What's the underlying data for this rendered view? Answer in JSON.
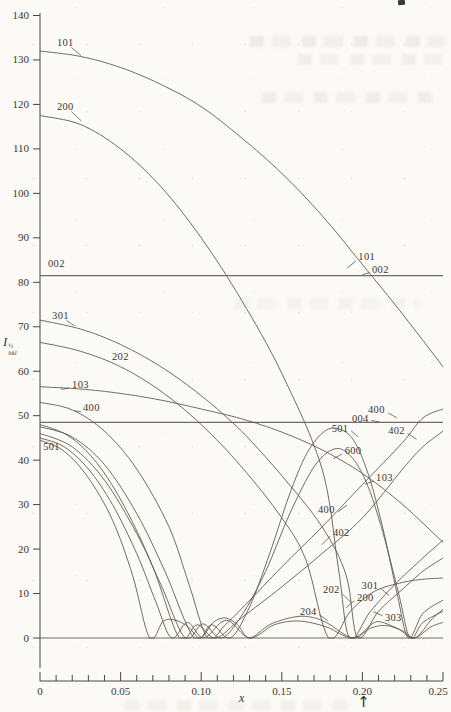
{
  "chart_data": {
    "type": "line",
    "title": "",
    "xlabel": "x",
    "ylabel": {
      "base": "I",
      "sup": "½",
      "sub": "hkl"
    },
    "xlim": [
      0,
      0.25
    ],
    "ylim": [
      0,
      140
    ],
    "grid": false,
    "legend": "none (curves labeled inline by hkl index)",
    "x_ticks": {
      "major": [
        0,
        0.05,
        0.1,
        0.15,
        0.2,
        0.25
      ],
      "labels": [
        "0",
        "0.05",
        "0.10",
        "0.15",
        "0.20",
        "0.25"
      ],
      "minor_step": 0.01
    },
    "y_ticks": {
      "values": [
        0,
        10,
        20,
        30,
        40,
        50,
        60,
        70,
        80,
        90,
        100,
        110,
        120,
        130,
        140
      ],
      "labels": [
        "0",
        "10",
        "20",
        "30",
        "40",
        "50",
        "60",
        "70",
        "80",
        "90",
        "100",
        "110",
        "120",
        "130",
        "140"
      ]
    },
    "series": [
      {
        "name": "101",
        "points": [
          [
            0,
            132
          ],
          [
            0.025,
            130.8
          ],
          [
            0.05,
            128.3
          ],
          [
            0.075,
            124.5
          ],
          [
            0.1,
            119.5
          ],
          [
            0.125,
            112.5
          ],
          [
            0.15,
            104.5
          ],
          [
            0.175,
            95
          ],
          [
            0.2,
            84
          ],
          [
            0.225,
            72.8
          ],
          [
            0.25,
            61
          ]
        ]
      },
      {
        "name": "200",
        "points": [
          [
            0,
            117.5
          ],
          [
            0.025,
            115.5
          ],
          [
            0.05,
            110
          ],
          [
            0.075,
            101.5
          ],
          [
            0.1,
            90
          ],
          [
            0.125,
            76
          ],
          [
            0.15,
            59.5
          ],
          [
            0.175,
            38
          ],
          [
            0.185,
            16
          ],
          [
            0.192,
            0
          ],
          [
            0.205,
            6
          ],
          [
            0.22,
            12
          ],
          [
            0.2375,
            18
          ],
          [
            0.25,
            22
          ]
        ]
      },
      {
        "name": "002",
        "points": [
          [
            0,
            81.5
          ],
          [
            0.25,
            81.5
          ]
        ]
      },
      {
        "name": "004",
        "points": [
          [
            0,
            48.5
          ],
          [
            0.25,
            48.5
          ]
        ]
      },
      {
        "name": "301",
        "points": [
          [
            0,
            71.5
          ],
          [
            0.025,
            69.5
          ],
          [
            0.05,
            66
          ],
          [
            0.075,
            61
          ],
          [
            0.1,
            54.5
          ],
          [
            0.125,
            46.5
          ],
          [
            0.15,
            36.5
          ],
          [
            0.175,
            25
          ],
          [
            0.19,
            14
          ],
          [
            0.197,
            0
          ],
          [
            0.21,
            6
          ],
          [
            0.225,
            11
          ],
          [
            0.2375,
            15
          ],
          [
            0.25,
            18
          ]
        ]
      },
      {
        "name": "202",
        "points": [
          [
            0,
            66.5
          ],
          [
            0.025,
            64.5
          ],
          [
            0.05,
            61
          ],
          [
            0.075,
            55.5
          ],
          [
            0.1,
            48
          ],
          [
            0.125,
            38.5
          ],
          [
            0.15,
            27
          ],
          [
            0.165,
            17.5
          ],
          [
            0.179,
            0
          ],
          [
            0.1925,
            6
          ],
          [
            0.2075,
            10.5
          ],
          [
            0.225,
            12.5
          ],
          [
            0.2375,
            13.2
          ],
          [
            0.25,
            13.5
          ]
        ]
      },
      {
        "name": "103",
        "points": [
          [
            0,
            56.5
          ],
          [
            0.025,
            56
          ],
          [
            0.05,
            55
          ],
          [
            0.075,
            53.5
          ],
          [
            0.1,
            51.5
          ],
          [
            0.125,
            49.3
          ],
          [
            0.15,
            46.3
          ],
          [
            0.175,
            42.3
          ],
          [
            0.2,
            37
          ],
          [
            0.225,
            30
          ],
          [
            0.25,
            21.5
          ]
        ]
      },
      {
        "name": "400",
        "points": [
          [
            0,
            53
          ],
          [
            0.02,
            51.3
          ],
          [
            0.04,
            46.5
          ],
          [
            0.06,
            38
          ],
          [
            0.08,
            25
          ],
          [
            0.0925,
            12
          ],
          [
            0.104,
            0
          ],
          [
            0.115,
            3
          ],
          [
            0.1275,
            7.5
          ],
          [
            0.15,
            16
          ],
          [
            0.175,
            25
          ],
          [
            0.2,
            34.5
          ],
          [
            0.225,
            44
          ],
          [
            0.2375,
            49.5
          ],
          [
            0.25,
            51.5
          ]
        ]
      },
      {
        "name": "402",
        "points": [
          [
            0,
            48
          ],
          [
            0.0175,
            45.5
          ],
          [
            0.035,
            39.5
          ],
          [
            0.0525,
            29.5
          ],
          [
            0.07,
            16
          ],
          [
            0.0865,
            0
          ],
          [
            0.0975,
            3
          ],
          [
            0.109,
            0
          ],
          [
            0.125,
            4.5
          ],
          [
            0.15,
            11.5
          ],
          [
            0.175,
            19
          ],
          [
            0.2,
            27
          ],
          [
            0.225,
            38
          ],
          [
            0.2375,
            43
          ],
          [
            0.25,
            46.5
          ]
        ]
      },
      {
        "name": "501",
        "points": [
          [
            0,
            47.5
          ],
          [
            0.02,
            45.2
          ],
          [
            0.04,
            39
          ],
          [
            0.06,
            28
          ],
          [
            0.0775,
            15
          ],
          [
            0.0955,
            0
          ],
          [
            0.1065,
            3
          ],
          [
            0.118,
            0
          ],
          [
            0.13,
            7
          ],
          [
            0.1425,
            19
          ],
          [
            0.1545,
            32
          ],
          [
            0.1655,
            41.5
          ],
          [
            0.1765,
            46.5
          ],
          [
            0.1855,
            47
          ],
          [
            0.1945,
            44.5
          ],
          [
            0.2035,
            37
          ],
          [
            0.2125,
            25
          ],
          [
            0.2215,
            10
          ],
          [
            0.2285,
            0
          ],
          [
            0.2375,
            5.5
          ],
          [
            0.25,
            8.5
          ]
        ]
      },
      {
        "name": "600",
        "points": [
          [
            0,
            46
          ],
          [
            0.02,
            43
          ],
          [
            0.04,
            35.5
          ],
          [
            0.06,
            23.5
          ],
          [
            0.075,
            12
          ],
          [
            0.09,
            0
          ],
          [
            0.101,
            3.2
          ],
          [
            0.1125,
            0
          ],
          [
            0.125,
            5
          ],
          [
            0.14,
            15
          ],
          [
            0.155,
            28
          ],
          [
            0.17,
            38.5
          ],
          [
            0.1825,
            42.5
          ],
          [
            0.1925,
            41
          ],
          [
            0.2025,
            35
          ],
          [
            0.2125,
            24
          ],
          [
            0.2225,
            10
          ],
          [
            0.2295,
            0
          ],
          [
            0.2375,
            3.5
          ],
          [
            0.25,
            6
          ]
        ]
      },
      {
        "name": "303",
        "points": [
          [
            0,
            45
          ],
          [
            0.015,
            43
          ],
          [
            0.03,
            38
          ],
          [
            0.045,
            30
          ],
          [
            0.06,
            19
          ],
          [
            0.072,
            8
          ],
          [
            0.0815,
            0
          ],
          [
            0.0915,
            3.5
          ],
          [
            0.1015,
            0
          ],
          [
            0.1155,
            4
          ],
          [
            0.13,
            0
          ],
          [
            0.1455,
            3
          ],
          [
            0.161,
            3.8
          ],
          [
            0.1775,
            2.5
          ],
          [
            0.194,
            0
          ],
          [
            0.2065,
            3.3
          ],
          [
            0.2125,
            3.5
          ],
          [
            0.2225,
            2
          ],
          [
            0.2325,
            0
          ],
          [
            0.2425,
            4
          ],
          [
            0.25,
            6.5
          ]
        ]
      },
      {
        "name": "204",
        "points": [
          [
            0,
            44.5
          ],
          [
            0.015,
            42
          ],
          [
            0.03,
            36
          ],
          [
            0.045,
            26.5
          ],
          [
            0.0575,
            14
          ],
          [
            0.068,
            0
          ],
          [
            0.0765,
            3.8
          ],
          [
            0.084,
            4
          ],
          [
            0.092,
            2.5
          ],
          [
            0.0995,
            0
          ],
          [
            0.1075,
            3.5
          ],
          [
            0.115,
            4.5
          ],
          [
            0.1225,
            3
          ],
          [
            0.13,
            0
          ],
          [
            0.1425,
            3
          ],
          [
            0.156,
            4.6
          ],
          [
            0.1665,
            4.8
          ],
          [
            0.1775,
            3.5
          ],
          [
            0.194,
            0
          ],
          [
            0.205,
            2.2
          ],
          [
            0.215,
            2.8
          ],
          [
            0.2255,
            1.5
          ],
          [
            0.2325,
            0
          ],
          [
            0.2425,
            2.5
          ],
          [
            0.25,
            3.5
          ]
        ]
      }
    ],
    "curve_labels": [
      {
        "text": "101",
        "x": 0.0105,
        "v": 134.0,
        "lead": [
          0.0195,
          132.8,
          0.0255,
          131.0
        ]
      },
      {
        "text": "200",
        "x": 0.0105,
        "v": 119.6,
        "lead": [
          0.0195,
          118.4,
          0.0255,
          116.3
        ]
      },
      {
        "text": "002",
        "x": 0.005,
        "v": 84.2
      },
      {
        "text": "301",
        "x": 0.0075,
        "v": 72.6,
        "lead": [
          0.0165,
          71.4,
          0.0215,
          70.2
        ]
      },
      {
        "text": "202",
        "x": 0.0447,
        "v": 63.4
      },
      {
        "text": "103",
        "x": 0.0199,
        "v": 57.1,
        "lead": [
          0.018,
          56.2,
          0.013,
          55.9
        ]
      },
      {
        "text": "400",
        "x": 0.0267,
        "v": 51.9,
        "lead": [
          0.0255,
          50.9,
          0.0215,
          51.1
        ]
      },
      {
        "text": "501",
        "x": 0.002,
        "v": 43.0
      },
      {
        "text": "101",
        "x": 0.1975,
        "v": 85.8,
        "lead": [
          0.196,
          84.8,
          0.1905,
          83.2
        ]
      },
      {
        "text": "002",
        "x": 0.206,
        "v": 82.9,
        "lead": [
          0.2045,
          82.2,
          0.2,
          81.7
        ]
      },
      {
        "text": "400",
        "x": 0.2035,
        "v": 51.3,
        "lead": [
          0.216,
          50.6,
          0.2215,
          49.5
        ]
      },
      {
        "text": "004",
        "x": 0.1935,
        "v": 49.4,
        "lead": [
          0.2055,
          48.9,
          0.2105,
          48.6
        ]
      },
      {
        "text": "501",
        "x": 0.181,
        "v": 47.2,
        "lead": [
          0.193,
          46.6,
          0.1975,
          45.2
        ]
      },
      {
        "text": "402",
        "x": 0.216,
        "v": 46.7,
        "lead": [
          0.228,
          46.0,
          0.2335,
          44.7
        ]
      },
      {
        "text": "600",
        "x": 0.189,
        "v": 42.2,
        "lead": [
          0.1875,
          41.4,
          0.182,
          40.3
        ]
      },
      {
        "text": "103",
        "x": 0.2085,
        "v": 36.2,
        "lead": [
          0.207,
          35.3,
          0.2015,
          34.6
        ]
      },
      {
        "text": "400",
        "x": 0.1725,
        "v": 28.8,
        "lead": [
          0.185,
          28.4,
          0.1905,
          29.9
        ]
      },
      {
        "text": "402",
        "x": 0.1817,
        "v": 23.8,
        "lead": [
          0.18,
          22.9,
          0.175,
          21.0
        ]
      },
      {
        "text": "202",
        "x": 0.1755,
        "v": 10.8,
        "lead": [
          0.1875,
          9.9,
          0.193,
          8.0
        ]
      },
      {
        "text": "301",
        "x": 0.1995,
        "v": 11.8,
        "lead": [
          0.211,
          11.2,
          0.2165,
          9.6
        ]
      },
      {
        "text": "200",
        "x": 0.1966,
        "v": 9.2,
        "lead": [
          0.195,
          8.4,
          0.1898,
          6.8
        ]
      },
      {
        "text": "204",
        "x": 0.1613,
        "v": 5.9,
        "lead": [
          0.173,
          5.3,
          0.1785,
          3.9
        ]
      },
      {
        "text": "303",
        "x": 0.214,
        "v": 4.6,
        "lead": [
          0.2125,
          5.0,
          0.2068,
          5.9
        ]
      }
    ],
    "annotations": {
      "arrow_glyph": "↑",
      "arrow_x": 0.2005
    },
    "colors": {
      "ink": "#5a534a",
      "paper": "#fbfaf6"
    }
  }
}
